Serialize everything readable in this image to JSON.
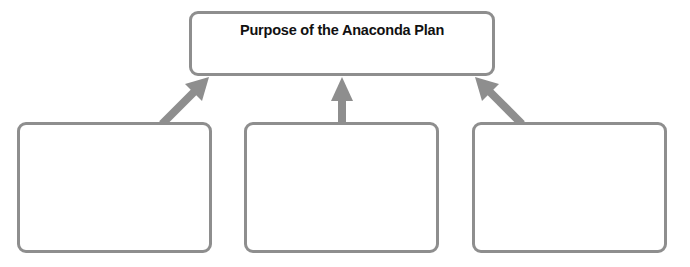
{
  "diagram": {
    "title_box": {
      "label": "Purpose of the Anaconda Plan"
    },
    "child_boxes": [
      {
        "position": "left",
        "label": ""
      },
      {
        "position": "middle",
        "label": ""
      },
      {
        "position": "right",
        "label": ""
      }
    ],
    "arrows": [
      {
        "from": "left",
        "to": "title_box",
        "direction": "up-right"
      },
      {
        "from": "middle",
        "to": "title_box",
        "direction": "up"
      },
      {
        "from": "right",
        "to": "title_box",
        "direction": "up-left"
      }
    ],
    "colors": {
      "border": "#8e8e8e",
      "arrow": "#8e8e8e",
      "title_text": "#111111",
      "background": "#ffffff"
    }
  }
}
